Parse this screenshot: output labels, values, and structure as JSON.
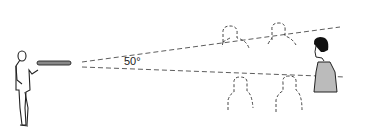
{
  "diagram": {
    "angle_label": "50°",
    "elements": {
      "observer": "person holding a tube",
      "target": "man in speckled shirt",
      "bystanders": 4
    },
    "colors": {
      "line": "#333333",
      "background": "#ffffff"
    }
  }
}
